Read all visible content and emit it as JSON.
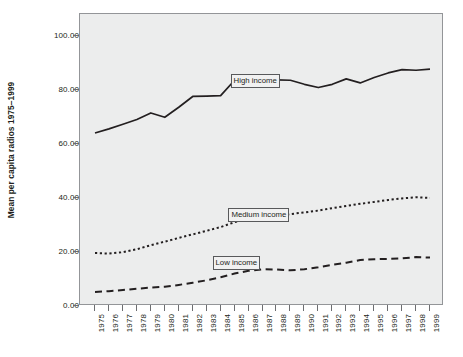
{
  "chart_data": {
    "type": "line",
    "title": "",
    "xlabel": "",
    "ylabel": "Mean per capita radios 1975–1999",
    "ylim": [
      0,
      108
    ],
    "yticks": [
      "0.00",
      "20.00",
      "40.00",
      "60.00",
      "80.00",
      "100.00"
    ],
    "ytick_values": [
      0,
      20,
      40,
      60,
      80,
      100
    ],
    "grid": false,
    "legend_position": "inline-labels",
    "categories": [
      "1975",
      "1976",
      "1977",
      "1978",
      "1979",
      "1980",
      "1981",
      "1982",
      "1983",
      "1984",
      "1985",
      "1986",
      "1987",
      "1988",
      "1989",
      "1990",
      "1991",
      "1992",
      "1993",
      "1994",
      "1995",
      "1996",
      "1997",
      "1998",
      "1999"
    ],
    "series": [
      {
        "name": "High income",
        "style": "solid",
        "label_text": "High income",
        "values": [
          64.0,
          65.5,
          67.2,
          69.0,
          71.4,
          69.8,
          73.5,
          77.5,
          77.6,
          77.8,
          83.5,
          83.6,
          83.6,
          83.6,
          83.5,
          82.0,
          80.8,
          82.0,
          84.0,
          82.5,
          84.5,
          86.2,
          87.4,
          87.2,
          87.6
        ]
      },
      {
        "name": "Medium income",
        "style": "dotted",
        "label_text": "Medium income",
        "values": [
          19.6,
          19.4,
          19.9,
          21.0,
          22.5,
          23.8,
          25.2,
          26.5,
          27.8,
          29.2,
          31.0,
          32.2,
          32.8,
          33.2,
          34.0,
          34.6,
          35.3,
          36.2,
          37.0,
          37.8,
          38.5,
          39.2,
          39.8,
          40.2,
          40.0
        ]
      },
      {
        "name": "Low income",
        "style": "dashed",
        "label_text": "Low income",
        "values": [
          5.2,
          5.5,
          5.9,
          6.4,
          6.8,
          7.1,
          7.8,
          8.6,
          9.5,
          10.6,
          12.0,
          13.0,
          13.6,
          13.5,
          13.2,
          13.6,
          14.3,
          15.2,
          16.0,
          17.0,
          17.3,
          17.4,
          17.6,
          18.1,
          17.9
        ]
      }
    ]
  },
  "labels": {
    "high_income": "High income",
    "medium_income": "Medium income",
    "low_income": "Low income"
  },
  "axis": {
    "y_title": "Mean per capita radios 1975–1999"
  },
  "colors": {
    "plot_background": "#eceded",
    "line": "#231f20",
    "frame": "#939598",
    "page_background": "#ffffff"
  }
}
